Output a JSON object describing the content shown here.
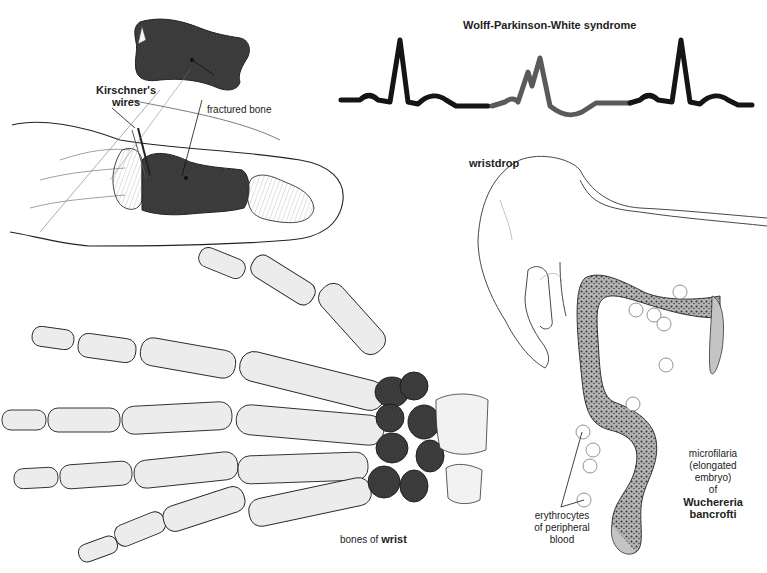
{
  "plate": {
    "colors": {
      "background": "#ffffff",
      "ink": "#1a1a1a",
      "bone_light": "#ececec",
      "bone_dark": "#3c3c3c",
      "ecg_line": "#151515",
      "ecg_wpw_segment": "#555555",
      "worm_body": "#b8b8b8"
    }
  },
  "finger_fracture": {
    "label_wires_line1": "Kirschner's",
    "label_wires_line2": "wires",
    "label_fractured_bone": "fractured bone"
  },
  "ecg": {
    "title": "Wolff-Parkinson-White syndrome"
  },
  "wristdrop": {
    "label": "wristdrop"
  },
  "hand_bones": {
    "label_prefix": "bones of",
    "label_term": "wrist"
  },
  "microfilaria": {
    "label_line1": "microfilaria",
    "label_line2": "(elongated",
    "label_line3": "embryo)",
    "label_line4": "of",
    "label_species_line1": "Wuchereria",
    "label_species_line2": "bancrofti",
    "label_erythrocytes_line1": "erythrocytes",
    "label_erythrocytes_line2": "of peripheral",
    "label_erythrocytes_line3": "blood"
  }
}
